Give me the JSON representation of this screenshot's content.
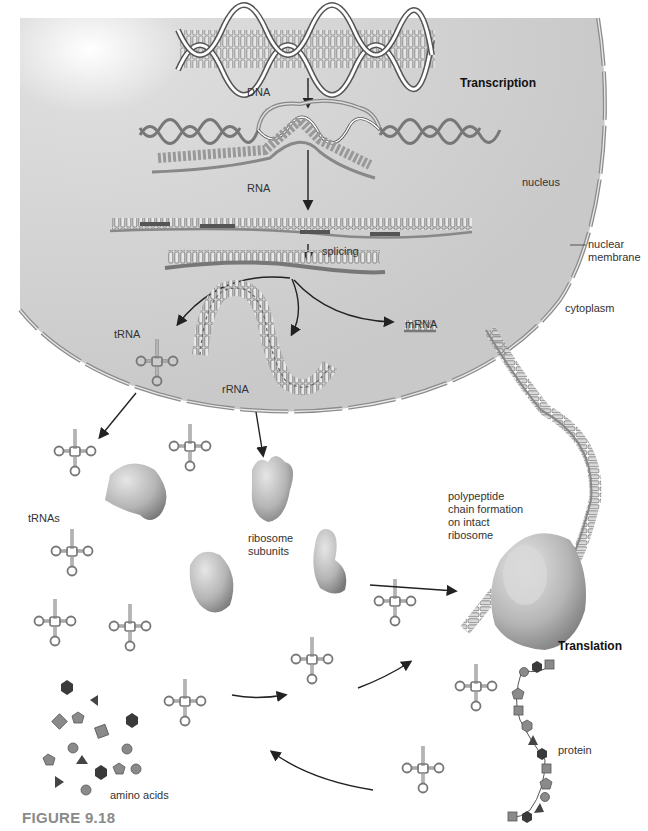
{
  "figure": {
    "caption": "FIGURE 9.18",
    "colors": {
      "nucleus_fill": "#cdcdcd",
      "membrane": "#8c8c8c",
      "strand_dark": "#6e6e6e",
      "base_light": "#e8e8e8",
      "base_dark": "#5a5a5a",
      "ribosome": "#b9b9b9",
      "arrow": "#222222",
      "amino_dark": "#3a3a3a",
      "amino_mid": "#8a8a8a"
    }
  },
  "labels": {
    "dna": "DNA",
    "transcription": "Transcription",
    "rna": "RNA",
    "nucleus": "nucleus",
    "splicing": "splicing",
    "nuclear_membrane": "nuclear\nmembrane",
    "cytoplasm": "cytoplasm",
    "trna": "tRNA",
    "rrna": "rRNA",
    "mrna": "mRNA",
    "trnas": "tRNAs",
    "ribosome_subunits": "ribosome\nsubunits",
    "polypeptide": "polypeptide\nchain formation\non intact\nribosome",
    "translation": "Translation",
    "protein": "protein",
    "amino_acids": "amino acids"
  },
  "stages": [
    {
      "name": "Transcription",
      "location": "nucleus",
      "steps": [
        "DNA",
        "RNA",
        "splicing",
        "tRNA / rRNA / mRNA"
      ]
    },
    {
      "name": "Translation",
      "location": "cytoplasm",
      "steps": [
        "tRNAs",
        "ribosome subunits",
        "polypeptide chain formation on intact ribosome",
        "protein"
      ]
    }
  ]
}
